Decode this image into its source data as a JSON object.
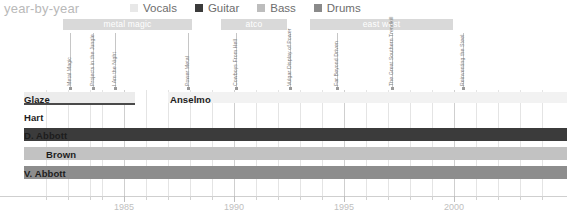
{
  "header": {
    "title": "year-by-year",
    "legend": [
      {
        "label": "Vocals",
        "color": "#e8e8e8"
      },
      {
        "label": "Guitar",
        "color": "#3b3b3b"
      },
      {
        "label": "Bass",
        "color": "#bdbdbd"
      },
      {
        "label": "Drums",
        "color": "#8a8a8a"
      }
    ]
  },
  "eras": [
    {
      "label": "metal magic",
      "x": 63,
      "width": 129
    },
    {
      "label": "atco",
      "x": 221,
      "width": 66
    },
    {
      "label": "east west",
      "x": 310,
      "width": 143
    }
  ],
  "albums": [
    {
      "label": "Metal Magic",
      "x": 70
    },
    {
      "label": "Projects in the Jungle",
      "x": 93
    },
    {
      "label": "I Am the Night",
      "x": 115
    },
    {
      "label": "Power Metal",
      "x": 188
    },
    {
      "label": "Cowboys From Hell",
      "x": 236
    },
    {
      "label": "Vulgar Display of Power",
      "x": 290
    },
    {
      "label": "Far Beyond Driven",
      "x": 337
    },
    {
      "label": "The Great Southern Trendkill",
      "x": 392
    },
    {
      "label": "Reinventing the Steel",
      "x": 463
    }
  ],
  "grid": {
    "major_x": [
      124,
      234,
      344,
      454
    ],
    "minor_x": [
      46,
      68,
      90,
      102,
      146,
      168,
      190,
      212,
      256,
      278,
      300,
      322,
      366,
      388,
      410,
      432,
      476,
      498,
      520,
      542
    ]
  },
  "chart_data": {
    "type": "bar",
    "title": "year-by-year",
    "xlabel": "",
    "ylabel": "",
    "xlim": [
      1981,
      2003
    ],
    "grid": true,
    "legend_position": "top",
    "categories": [
      "Glaze",
      "Hart",
      "D. Abbott",
      "Brown",
      "V. Abbott",
      "Anselmo"
    ],
    "series": [
      {
        "name": "Vocals",
        "color": "#e8e8e8"
      },
      {
        "name": "Guitar",
        "color": "#3b3b3b"
      },
      {
        "name": "Bass",
        "color": "#bdbdbd"
      },
      {
        "name": "Drums",
        "color": "#8a8a8a"
      }
    ],
    "rows": [
      {
        "label": "Glaze",
        "label_x": 24,
        "label_y": 95,
        "y": 92,
        "height": 11,
        "instrument": "Vocals",
        "bars": [
          {
            "x": 24,
            "width": 111,
            "color": "#ececec"
          }
        ],
        "underline": {
          "x": 24,
          "width": 111,
          "y": 103,
          "color": "#4a4a4a"
        }
      },
      {
        "label": "Anselmo",
        "label_x": 170,
        "label_y": 95,
        "y": 92,
        "height": 11,
        "instrument": "Vocals",
        "bars": [
          {
            "x": 168,
            "width": 399,
            "color": "#f2f2f2"
          }
        ]
      },
      {
        "label": "Hart",
        "label_x": 24,
        "label_y": 113,
        "y": 110,
        "height": 11,
        "instrument": "Bass",
        "bars": [
          {
            "x": 24,
            "width": 0,
            "color": "#bdbdbd"
          }
        ]
      },
      {
        "label": "D. Abbott",
        "label_x": 24,
        "label_y": 131,
        "y": 128,
        "height": 13,
        "instrument": "Guitar",
        "bars": [
          {
            "x": 24,
            "width": 543,
            "color": "#3b3b3b"
          }
        ]
      },
      {
        "label": "Brown",
        "label_x": 46,
        "label_y": 150,
        "y": 147,
        "height": 13,
        "instrument": "Bass",
        "bars": [
          {
            "x": 24,
            "width": 543,
            "color": "#c2c2c2"
          }
        ]
      },
      {
        "label": "V. Abbott",
        "label_x": 24,
        "label_y": 169,
        "y": 166,
        "height": 13,
        "instrument": "Drums",
        "bars": [
          {
            "x": 24,
            "width": 543,
            "color": "#8d8d8d"
          }
        ]
      }
    ],
    "tick_labels": [
      "1985",
      "1990",
      "1995",
      "2000"
    ],
    "tick_x": [
      124,
      234,
      344,
      454
    ]
  }
}
